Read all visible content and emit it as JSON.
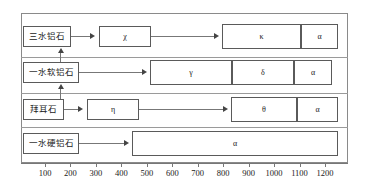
{
  "diagram": {
    "title": "",
    "type": "phase-transformation-timeline",
    "axis": {
      "unit_label": "",
      "ticks": [
        100,
        200,
        300,
        400,
        500,
        600,
        700,
        800,
        900,
        1000,
        1100,
        1200
      ],
      "tick_labels": [
        "100",
        "200",
        "300",
        "400",
        "500",
        "600",
        "700",
        "800",
        "900",
        "1000",
        "1100",
        "1200"
      ],
      "range": [
        30,
        1300
      ]
    },
    "colors": {
      "frame": "#8a8a8a",
      "box_border": "#5a5a5a",
      "connector": "#777777",
      "arrow": "#444444",
      "text": "#1a1a1a",
      "background": "#ffffff"
    },
    "rows": [
      {
        "id": "gibbsite",
        "label": "三水铝石",
        "phases": [
          {
            "symbol": "χ",
            "start": 300,
            "end": 500
          },
          {
            "symbol": "κ",
            "start": 800,
            "end": 1110
          },
          {
            "symbol": "α",
            "start": 1110,
            "end": 1255
          }
        ]
      },
      {
        "id": "boehmite",
        "label": "一水软铝石",
        "phases": [
          {
            "symbol": "γ",
            "start": 500,
            "end": 835
          },
          {
            "symbol": "δ",
            "start": 835,
            "end": 1080
          },
          {
            "symbol": "α",
            "start": 1080,
            "end": 1230
          }
        ]
      },
      {
        "id": "bayerite",
        "label": "拜耳石",
        "phases": [
          {
            "symbol": "η",
            "start": 280,
            "end": 480
          },
          {
            "symbol": "θ",
            "start": 870,
            "end": 1120
          },
          {
            "symbol": "α",
            "start": 1120,
            "end": 1255
          }
        ]
      },
      {
        "id": "diaspore",
        "label": "一水硬铝石",
        "phases": [
          {
            "symbol": "α",
            "start": 500,
            "end": 1255
          }
        ]
      }
    ]
  }
}
